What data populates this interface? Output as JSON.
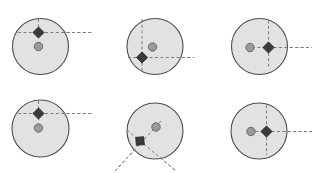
{
  "figure": {
    "width": 318,
    "height": 173,
    "background": "#ffffff",
    "title": "",
    "rows": 2,
    "cols": 3,
    "panel_count": 6
  },
  "style": {
    "circle_fill": "#e2e2e2",
    "circle_stroke": "#4d4d4d",
    "circle_stroke_width": 1.1,
    "dot_fill": "#9a9a9a",
    "dot_stroke": "#6a6a6a",
    "dot_radius": 4.2,
    "diamond_fill": "#3a3a3a",
    "diamond_stroke": "#222222",
    "diamond_radius": 5.6,
    "dash_stroke": "#7d7d7d",
    "dash_stroke_width": 1.0,
    "dash_pattern": "3,2.4"
  },
  "chart_data": {
    "type": "scatter",
    "title": "",
    "xlabel": "",
    "ylabel": "",
    "grid": false,
    "legend": "none",
    "series": [
      {
        "name": "disk",
        "marker": "circle-outline"
      },
      {
        "name": "centroid",
        "marker": "filled-circle"
      },
      {
        "name": "target",
        "marker": "filled-diamond"
      },
      {
        "name": "crosshair",
        "marker": "dashed-lines"
      }
    ],
    "panels": [
      {
        "index": 1,
        "label": "panel-1",
        "circle": {
          "cx": 40.5,
          "cy": 46.5,
          "r": 28.0
        },
        "dot": {
          "cx": 38.5,
          "cy": 46.5
        },
        "diamond": {
          "cx": 38.5,
          "cy": 32.5,
          "angle": 0
        },
        "lines": [
          {
            "kind": "vertical",
            "angle": 90,
            "x1": 38.5,
            "y1": 19.0,
            "x2": 38.5,
            "y2": 40.0
          },
          {
            "kind": "horizontal",
            "angle": 0,
            "x1": 18.0,
            "y1": 32.5,
            "x2": 92.0,
            "y2": 32.5
          }
        ]
      },
      {
        "index": 2,
        "label": "panel-2",
        "circle": {
          "cx": 155.0,
          "cy": 46.5,
          "r": 28.0
        },
        "dot": {
          "cx": 152.5,
          "cy": 47.0
        },
        "diamond": {
          "cx": 142.0,
          "cy": 57.5,
          "angle": 0
        },
        "lines": [
          {
            "kind": "vertical",
            "angle": 90,
            "x1": 142.0,
            "y1": 19.5,
            "x2": 142.0,
            "y2": 73.0
          },
          {
            "kind": "horizontal",
            "angle": 0,
            "x1": 128.0,
            "y1": 57.5,
            "x2": 194.0,
            "y2": 57.5
          }
        ]
      },
      {
        "index": 3,
        "label": "panel-3",
        "circle": {
          "cx": 259.5,
          "cy": 46.5,
          "r": 28.0
        },
        "dot": {
          "cx": 250.0,
          "cy": 47.5
        },
        "diamond": {
          "cx": 268.5,
          "cy": 47.5,
          "angle": 0
        },
        "lines": [
          {
            "kind": "vertical",
            "angle": 90,
            "x1": 268.5,
            "y1": 20.5,
            "x2": 268.5,
            "y2": 69.0
          },
          {
            "kind": "horizontal",
            "angle": 0,
            "x1": 252.0,
            "y1": 47.5,
            "x2": 312.0,
            "y2": 47.5
          }
        ]
      },
      {
        "index": 4,
        "label": "panel-4",
        "circle": {
          "cx": 40.5,
          "cy": 128.5,
          "r": 28.5
        },
        "dot": {
          "cx": 38.5,
          "cy": 128.0
        },
        "diamond": {
          "cx": 38.5,
          "cy": 113.5,
          "angle": 0
        },
        "lines": [
          {
            "kind": "vertical",
            "angle": 90,
            "x1": 38.5,
            "y1": 101.0,
            "x2": 38.5,
            "y2": 121.0
          },
          {
            "kind": "horizontal",
            "angle": 0,
            "x1": 18.0,
            "y1": 113.5,
            "x2": 92.0,
            "y2": 113.5
          }
        ]
      },
      {
        "index": 5,
        "label": "panel-5",
        "circle": {
          "cx": 155.0,
          "cy": 131.0,
          "r": 28.0
        },
        "dot": {
          "cx": 156.0,
          "cy": 127.0
        },
        "diamond": {
          "cx": 140.0,
          "cy": 141.0,
          "angle": 40
        },
        "lines": [
          {
            "kind": "rotated-a",
            "angle": 40,
            "x1": 127.0,
            "y1": 130.0,
            "x2": 176.0,
            "y2": 171.0
          },
          {
            "kind": "rotated-b",
            "angle": -50,
            "x1": 161.0,
            "y1": 121.0,
            "x2": 115.0,
            "y2": 171.0
          }
        ]
      },
      {
        "index": 6,
        "label": "panel-6",
        "circle": {
          "cx": 259.0,
          "cy": 131.0,
          "r": 28.0
        },
        "dot": {
          "cx": 251.0,
          "cy": 131.5
        },
        "diamond": {
          "cx": 266.5,
          "cy": 131.5,
          "angle": 0
        },
        "lines": [
          {
            "kind": "vertical",
            "angle": 90,
            "x1": 266.5,
            "y1": 105.0,
            "x2": 266.5,
            "y2": 155.0
          },
          {
            "kind": "horizontal",
            "angle": 0,
            "x1": 250.0,
            "y1": 131.5,
            "x2": 312.0,
            "y2": 131.5
          }
        ]
      }
    ]
  }
}
